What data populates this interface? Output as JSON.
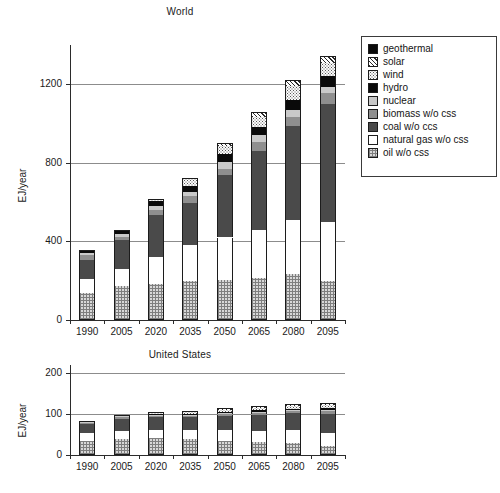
{
  "figure": {
    "ylabel": "EJ/year"
  },
  "legend": {
    "position": "right",
    "items": [
      {
        "label": "geothermal",
        "fill": "black",
        "color": "#0a0a0a"
      },
      {
        "label": "solar",
        "fill": "solar",
        "color": "#ffffff"
      },
      {
        "label": "wind",
        "fill": "wind",
        "color": "#fbfbfb"
      },
      {
        "label": "hydro",
        "fill": "black",
        "color": "#0a0a0a"
      },
      {
        "label": "nuclear",
        "fill": "ltgray",
        "color": "#c9c9c9"
      },
      {
        "label": "biomass w/o css",
        "fill": "medgray",
        "color": "#8f8f8f"
      },
      {
        "label": "coal w/o ccs",
        "fill": "dkgray",
        "color": "#4a4a4a"
      },
      {
        "label": "natural gas w/o css",
        "fill": "white",
        "color": "#ffffff"
      },
      {
        "label": "oil w/o css",
        "fill": "oil",
        "color": "#d8d8d8"
      }
    ]
  },
  "chart_data": [
    {
      "type": "bar",
      "stacked": true,
      "title": "World",
      "xlabel": "",
      "ylabel": "EJ/year",
      "categories": [
        "1990",
        "2005",
        "2020",
        "2035",
        "2050",
        "2065",
        "2080",
        "2095"
      ],
      "ylim": [
        0,
        1400
      ],
      "yticks": [
        0,
        400,
        800,
        1200
      ],
      "ytick_labels": [
        "0",
        "400",
        "800",
        "1200"
      ],
      "grid": "horizontal",
      "series": [
        {
          "name": "oil w/o css",
          "fill": "oil",
          "values": [
            140,
            175,
            185,
            200,
            205,
            215,
            235,
            200
          ]
        },
        {
          "name": "natural gas w/o css",
          "fill": "white",
          "values": [
            70,
            85,
            135,
            180,
            215,
            245,
            275,
            300
          ]
        },
        {
          "name": "coal w/o ccs",
          "fill": "dkgray",
          "values": [
            95,
            145,
            215,
            215,
            320,
            400,
            480,
            600
          ]
        },
        {
          "name": "biomass w/o css",
          "fill": "medgray",
          "values": [
            25,
            20,
            25,
            35,
            30,
            45,
            45,
            55
          ]
        },
        {
          "name": "nuclear",
          "fill": "ltgray",
          "values": [
            10,
            15,
            20,
            20,
            35,
            35,
            35,
            30
          ]
        },
        {
          "name": "hydro",
          "fill": "black",
          "values": [
            15,
            18,
            25,
            30,
            40,
            45,
            50,
            55
          ]
        },
        {
          "name": "wind",
          "fill": "wind",
          "values": [
            0,
            2,
            8,
            40,
            40,
            50,
            70,
            70
          ]
        },
        {
          "name": "solar",
          "fill": "solar",
          "values": [
            0,
            0,
            2,
            5,
            15,
            20,
            25,
            30
          ]
        },
        {
          "name": "geothermal",
          "fill": "black",
          "values": [
            0,
            0,
            0,
            0,
            0,
            5,
            5,
            5
          ]
        }
      ],
      "totals": [
        355,
        460,
        595,
        775,
        920,
        1070,
        1215,
        1345
      ]
    },
    {
      "type": "bar",
      "stacked": true,
      "title": "United States",
      "xlabel": "",
      "ylabel": "EJ/year",
      "categories": [
        "1990",
        "2005",
        "2020",
        "2035",
        "2050",
        "2065",
        "2080",
        "2095"
      ],
      "ylim": [
        0,
        220
      ],
      "yticks": [
        0,
        100,
        200
      ],
      "ytick_labels": [
        "0",
        "100",
        "200"
      ],
      "grid": "horizontal",
      "series": [
        {
          "name": "oil w/o css",
          "fill": "oil",
          "values": [
            35,
            40,
            41,
            38,
            35,
            31,
            30,
            23
          ]
        },
        {
          "name": "natural gas w/o css",
          "fill": "white",
          "values": [
            19,
            18,
            20,
            24,
            27,
            28,
            32,
            30
          ]
        },
        {
          "name": "coal w/o ccs",
          "fill": "dkgray",
          "values": [
            22,
            30,
            33,
            30,
            33,
            40,
            40,
            48
          ]
        },
        {
          "name": "biomass w/o css",
          "fill": "medgray",
          "values": [
            3,
            4,
            3,
            4,
            4,
            4,
            5,
            6
          ]
        },
        {
          "name": "nuclear",
          "fill": "ltgray",
          "values": [
            2,
            3,
            2,
            2,
            3,
            3,
            3,
            4
          ]
        },
        {
          "name": "hydro",
          "fill": "black",
          "values": [
            3,
            3,
            2,
            3,
            3,
            3,
            3,
            4
          ]
        },
        {
          "name": "wind",
          "fill": "wind",
          "values": [
            0,
            1,
            2,
            5,
            6,
            6,
            6,
            7
          ]
        },
        {
          "name": "solar",
          "fill": "solar",
          "values": [
            0,
            0,
            1,
            2,
            3,
            4,
            4,
            5
          ]
        },
        {
          "name": "geothermal",
          "fill": "black",
          "values": [
            0,
            0,
            0,
            0,
            0,
            0,
            1,
            1
          ]
        }
      ],
      "totals": [
        84,
        99,
        104,
        108,
        114,
        119,
        124,
        128
      ]
    }
  ]
}
